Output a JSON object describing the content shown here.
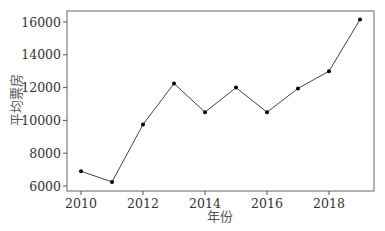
{
  "chart_data": {
    "type": "line",
    "title": "",
    "xlabel": "年份",
    "ylabel": "平均票房",
    "x": [
      2010,
      2011,
      2012,
      2013,
      2014,
      2015,
      2016,
      2017,
      2018,
      2019
    ],
    "series": [
      {
        "name": "平均票房",
        "values": [
          6900,
          6250,
          9750,
          12250,
          10500,
          12000,
          10500,
          11950,
          13000,
          16150
        ]
      }
    ],
    "xticks": [
      2010,
      2012,
      2014,
      2016,
      2018
    ],
    "yticks": [
      6000,
      8000,
      10000,
      12000,
      14000,
      16000
    ],
    "xlim": [
      2009.55,
      2019.45
    ],
    "ylim": [
      5700,
      16700
    ],
    "grid": false,
    "legend": false,
    "colors": {
      "line": "#444444",
      "marker": "#000000",
      "axis": "#555555"
    }
  }
}
